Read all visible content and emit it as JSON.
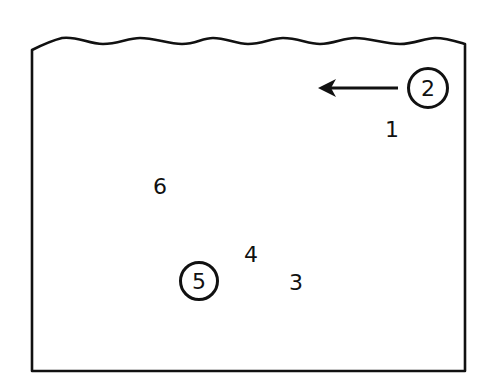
{
  "diagram": {
    "type": "container-with-water-surface",
    "colors": {
      "stroke": "#111111",
      "background": "#ffffff"
    },
    "container": {
      "left": 32,
      "right": 465,
      "top_left_y": 50,
      "top_right_y": 44,
      "bottom": 371,
      "wavy_top": true
    },
    "arrow": {
      "from": [
        398,
        88
      ],
      "to": [
        318,
        88
      ],
      "direction": "left",
      "points_from_label": "2"
    },
    "labels": [
      {
        "id": "1",
        "text": "1",
        "x": 392,
        "y": 130,
        "circled": false
      },
      {
        "id": "2",
        "text": "2",
        "x": 428,
        "y": 88,
        "circled": true,
        "r": 21
      },
      {
        "id": "3",
        "text": "3",
        "x": 296,
        "y": 283,
        "circled": false
      },
      {
        "id": "4",
        "text": "4",
        "x": 251,
        "y": 255,
        "circled": false
      },
      {
        "id": "5",
        "text": "5",
        "x": 199,
        "y": 281,
        "circled": true,
        "r": 20
      },
      {
        "id": "6",
        "text": "6",
        "x": 160,
        "y": 187,
        "circled": false
      }
    ]
  }
}
